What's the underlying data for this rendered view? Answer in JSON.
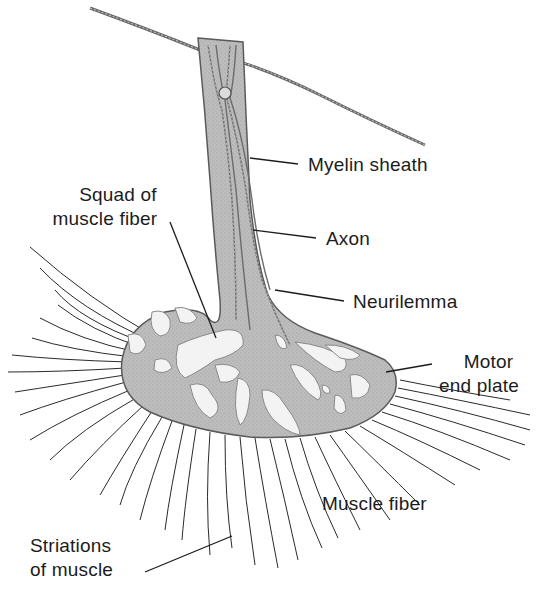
{
  "diagram": {
    "background": "#ffffff",
    "colors": {
      "tissue_fill": "#b9b9b9",
      "tissue_stipple": "#a6a6a6",
      "outline": "#5a5a5a",
      "clear_zone": "#f3f3f3",
      "fiber_line": "#2a2a2a",
      "text": "#1c1c1c"
    },
    "labels": {
      "myelin_sheath": "Myelin sheath",
      "axon": "Axon",
      "neurilemma": "Neurilemma",
      "squad_line1": "Squad of",
      "squad_line2": "muscle fiber",
      "motor_line1": "Motor",
      "motor_line2": "end plate",
      "muscle_fiber": "Muscle fiber",
      "striations_line1": "Striations",
      "striations_line2": "of muscle"
    }
  }
}
